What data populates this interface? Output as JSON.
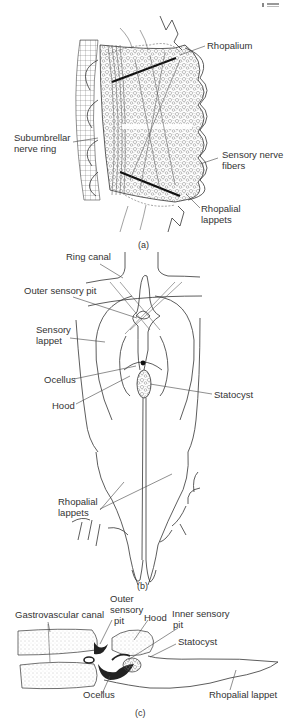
{
  "figure": {
    "page_fragment": "7 2",
    "panels": [
      {
        "id": "a",
        "caption": "(a)",
        "labels": {
          "rhopalium": "Rhopalium",
          "subumbrellar_line1": "Subumbrellar",
          "subumbrellar_line2": "nerve ring",
          "sensory_line1": "Sensory nerve",
          "sensory_line2": "fibers",
          "lappets_line1": "Rhopalial",
          "lappets_line2": "lappets"
        }
      },
      {
        "id": "b",
        "caption": "(b)",
        "labels": {
          "ring_canal": "Ring canal",
          "outer_sensory_pit": "Outer sensory pit",
          "sensory_lappet_line1": "Sensory",
          "sensory_lappet_line2": "lappet",
          "ocellus": "Ocellus",
          "hood": "Hood",
          "statocyst": "Statocyst",
          "rhopalial_lappets_line1": "Rhopalial",
          "rhopalial_lappets_line2": "lappets"
        }
      },
      {
        "id": "c",
        "caption": "(c)",
        "labels": {
          "gastrovascular_canal": "Gastrovascular canal",
          "outer_pit_line1": "Outer",
          "outer_pit_line2": "sensory",
          "outer_pit_line3": "pit",
          "hood": "Hood",
          "inner_pit_line1": "Inner sensory",
          "inner_pit_line2": "pit",
          "statocyst": "Statocyst",
          "ocellus": "Ocellus",
          "rhopalial_lappet": "Rhopalial lappet"
        }
      }
    ]
  },
  "colors": {
    "background": "#ffffff",
    "ink": "#333333",
    "stipple": "#bdbdbd"
  }
}
